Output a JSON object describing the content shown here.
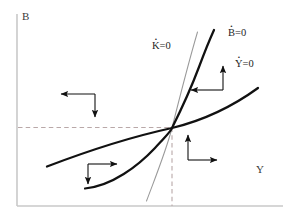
{
  "figure": {
    "type": "phase-diagram",
    "width": 287,
    "height": 224,
    "background": "#ffffff"
  },
  "axes": {
    "vertical": {
      "label": "B",
      "color": "#c9c9c9",
      "x": 17,
      "y_top": 14,
      "y_bottom": 206
    },
    "horizontal": {
      "label": "Y",
      "color": "#c9c9c9",
      "y": 206,
      "x_left": 17,
      "x_right": 283
    }
  },
  "steady_state": {
    "x": 172,
    "y": 128,
    "guide_color": "#b9a8a8",
    "guide_style": "dashed"
  },
  "curves": [
    {
      "name": "K-dot-nullcline",
      "label": "K=0",
      "label_var": "K",
      "label_eq": "=0",
      "color": "#9a9a9a",
      "width": 1.0,
      "shape": "steep-near-linear"
    },
    {
      "name": "B-dot-nullcline",
      "label": "B=0",
      "label_var": "B",
      "label_eq": "=0",
      "color": "#111111",
      "width": 2.2,
      "shape": "convex-exponential"
    },
    {
      "name": "Y-dot-nullcline",
      "label": "Y=0",
      "label_var": "Y",
      "label_eq": "=0",
      "color": "#111111",
      "width": 2.2,
      "shape": "gentle-concave"
    }
  ],
  "arrow_clusters": [
    {
      "name": "upper-left-quadrant",
      "directions": [
        "left",
        "down"
      ],
      "corner_x": 95,
      "corner_y": 94,
      "h_len": 38,
      "v_len": 27
    },
    {
      "name": "lower-left-quadrant",
      "directions": [
        "right",
        "down"
      ],
      "corner_x": 88,
      "corner_y": 164,
      "h_len": 33,
      "v_len": 24
    },
    {
      "name": "lower-right-quadrant",
      "directions": [
        "up",
        "right"
      ],
      "corner_x": 188,
      "corner_y": 160,
      "h_len": 33,
      "v_len": 29
    },
    {
      "name": "upper-right-quadrant",
      "directions": [
        "up",
        "left"
      ],
      "corner_x": 223,
      "corner_y": 90,
      "h_len": 36,
      "v_len": 28
    }
  ],
  "colors": {
    "curve_dark": "#111111",
    "curve_light": "#9a9a9a",
    "axis": "#c9c9c9",
    "dashed_guide": "#b9a8a8",
    "arrow": "#111111",
    "text": "#1d1d1d"
  }
}
